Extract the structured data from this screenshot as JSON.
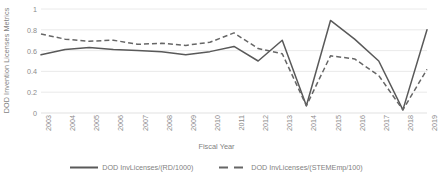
{
  "chart_data": {
    "type": "line",
    "title": "",
    "xlabel": "Fiscal Year",
    "ylabel": "DOD Invention Licenses Metrics",
    "ylim": [
      0,
      1
    ],
    "yticks": [
      "0",
      "0.2",
      "0.4",
      "0.6",
      "0.8",
      "1"
    ],
    "grid": true,
    "legend_position": "bottom",
    "categories": [
      "2003",
      "2004",
      "2005",
      "2006",
      "2007",
      "2008",
      "2009",
      "2010",
      "2011",
      "2012",
      "2013",
      "2014",
      "2015",
      "2016",
      "2017",
      "2018",
      "2019"
    ],
    "series": [
      {
        "name": "DOD InvLicenses/(RD/1000)",
        "style": "solid",
        "color": "#595959",
        "values": [
          0.56,
          0.61,
          0.63,
          0.61,
          0.6,
          0.59,
          0.56,
          0.59,
          0.64,
          0.5,
          0.7,
          0.07,
          0.89,
          0.71,
          0.5,
          0.03,
          0.8
        ]
      },
      {
        "name": "DOD InvLicenses/(STEMEmp/100)",
        "style": "dashed",
        "color": "#666666",
        "values": [
          0.76,
          0.71,
          0.69,
          0.7,
          0.66,
          0.67,
          0.65,
          0.68,
          0.77,
          0.62,
          0.57,
          0.07,
          0.55,
          0.52,
          0.36,
          0.03,
          0.42
        ]
      }
    ]
  },
  "legend": {
    "entries": [
      {
        "label": "DOD InvLicenses/(RD/1000)"
      },
      {
        "label": "DOD InvLicenses/(STEMEmp/100)"
      }
    ]
  }
}
